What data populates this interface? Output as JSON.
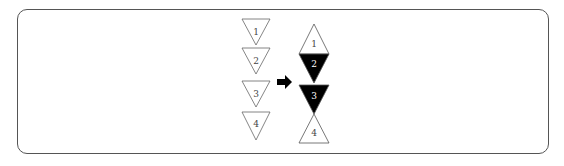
{
  "diagram": {
    "left_column": {
      "triangles": [
        {
          "label": "1",
          "orientation": "down",
          "fill": "#ffffff"
        },
        {
          "label": "2",
          "orientation": "down",
          "fill": "#ffffff"
        },
        {
          "label": "3",
          "orientation": "down",
          "fill": "#ffffff"
        },
        {
          "label": "4",
          "orientation": "down",
          "fill": "#ffffff"
        }
      ]
    },
    "arrow": {
      "direction": "right",
      "color": "#000000"
    },
    "right_column": {
      "triangles": [
        {
          "label": "1",
          "orientation": "up",
          "fill": "#ffffff"
        },
        {
          "label": "2",
          "orientation": "down",
          "fill": "#000000"
        },
        {
          "label": "3",
          "orientation": "down",
          "fill": "#000000"
        },
        {
          "label": "4",
          "orientation": "up",
          "fill": "#ffffff"
        }
      ]
    }
  }
}
